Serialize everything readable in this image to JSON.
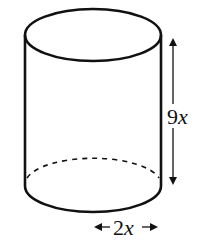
{
  "figure": {
    "shape": "cylinder",
    "height_label": {
      "coef": "9",
      "var": "x"
    },
    "diameter_label": {
      "coef": "2",
      "var": "x"
    },
    "stroke_color": "#111111",
    "background": "#ffffff"
  }
}
